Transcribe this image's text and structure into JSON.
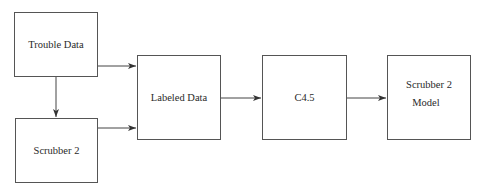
{
  "diagram": {
    "type": "flowchart",
    "nodes": [
      {
        "id": "trouble_data",
        "label": "Trouble Data"
      },
      {
        "id": "scrubber2",
        "label": "Scrubber 2"
      },
      {
        "id": "labeled_data",
        "label": "Labeled Data"
      },
      {
        "id": "c45",
        "label": "C4.5"
      },
      {
        "id": "model",
        "label_line1": "Scrubber 2",
        "label_line2": "Model"
      }
    ],
    "edges": [
      {
        "from": "trouble_data",
        "to": "scrubber2"
      },
      {
        "from": "trouble_data",
        "to": "labeled_data"
      },
      {
        "from": "scrubber2",
        "to": "labeled_data"
      },
      {
        "from": "labeled_data",
        "to": "c45"
      },
      {
        "from": "c45",
        "to": "model"
      }
    ]
  }
}
